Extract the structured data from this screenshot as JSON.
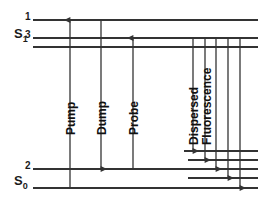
{
  "figure": {
    "type": "energy-level-diagram",
    "background": "#ffffff",
    "line_color": "#333333",
    "text_color": "#1a1a1a"
  },
  "states": {
    "excited": {
      "label": "S",
      "subscript": "1"
    },
    "ground": {
      "label": "S",
      "subscript": "0"
    }
  },
  "levels": {
    "level_1": "1",
    "level_3": "3",
    "level_2": "2"
  },
  "transitions": {
    "pump": "Pump",
    "dump": "Dump",
    "probe": "Probe"
  },
  "emission": {
    "line1": "Dispersed",
    "line2": "Fluorescence"
  },
  "chart_data": {
    "type": "diagram",
    "manifolds": [
      {
        "name": "S1",
        "label": "S",
        "subscript": "1",
        "lines": [
          {
            "id": "s1-level-1",
            "label": "1",
            "y": 20,
            "x_start": 33,
            "x_end": 258
          },
          {
            "id": "s1-level-3",
            "label": "3",
            "y": 38,
            "x_start": 33,
            "x_end": 258
          },
          {
            "id": "s1-unlabeled",
            "label": "",
            "y": 47,
            "x_start": 33,
            "x_end": 258
          }
        ]
      },
      {
        "name": "S0",
        "label": "S",
        "subscript": "0",
        "lines": [
          {
            "id": "s0-upper-a",
            "label": "",
            "y": 151,
            "x_start": 184,
            "x_end": 258
          },
          {
            "id": "s0-upper-b",
            "label": "",
            "y": 160,
            "x_start": 188,
            "x_end": 258
          },
          {
            "id": "s0-level-2",
            "label": "2",
            "y": 169,
            "x_start": 33,
            "x_end": 258
          },
          {
            "id": "s0-lower-a",
            "label": "",
            "y": 178,
            "x_start": 188,
            "x_end": 258
          },
          {
            "id": "s0-ground",
            "label": "",
            "y": 188,
            "x_start": 33,
            "x_end": 258
          }
        ]
      }
    ],
    "arrows": [
      {
        "id": "pump",
        "label": "Pump",
        "x": 70,
        "y_from": 188,
        "y_to": 20,
        "direction": "up"
      },
      {
        "id": "dump",
        "label": "Dump",
        "x": 101,
        "y_from": 20,
        "y_to": 169,
        "direction": "down"
      },
      {
        "id": "probe",
        "label": "Probe",
        "x": 133,
        "y_from": 169,
        "y_to": 38,
        "direction": "up"
      },
      {
        "id": "fluor-1",
        "label": "Dispersed Fluorescence",
        "x": 193,
        "y_from": 38,
        "y_to": 151,
        "direction": "down"
      },
      {
        "id": "fluor-2",
        "label": "Dispersed Fluorescence",
        "x": 205,
        "y_from": 38,
        "y_to": 160,
        "direction": "down"
      },
      {
        "id": "fluor-3",
        "label": "Dispersed Fluorescence",
        "x": 216,
        "y_from": 38,
        "y_to": 169,
        "direction": "down"
      },
      {
        "id": "fluor-4",
        "label": "Dispersed Fluorescence",
        "x": 228,
        "y_from": 38,
        "y_to": 178,
        "direction": "down"
      },
      {
        "id": "fluor-5",
        "label": "Dispersed Fluorescence",
        "x": 240,
        "y_from": 38,
        "y_to": 188,
        "direction": "down"
      }
    ]
  }
}
